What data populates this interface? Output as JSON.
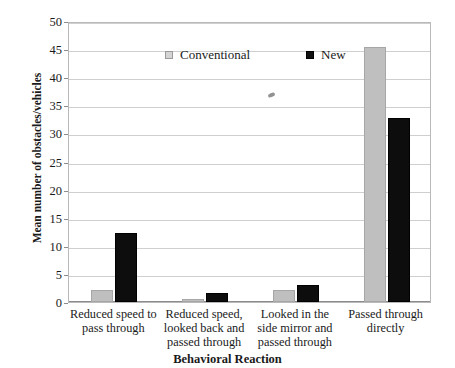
{
  "chart_data": {
    "type": "bar",
    "title": "",
    "xlabel": "Behavioral Reaction",
    "ylabel": "Mean number of obstacles/vehicles",
    "categories": [
      "Reduced speed to pass through",
      "Reduced speed, looked back and passed through",
      "Looked in the side mirror and passed through",
      "Passed through directly"
    ],
    "series": [
      {
        "name": "Conventional",
        "color": "#bfbfbf",
        "values": [
          2.1,
          0.5,
          2.2,
          45.3
        ]
      },
      {
        "name": "New",
        "color": "#0d0d0d",
        "values": [
          12.3,
          1.6,
          3.0,
          32.7
        ]
      }
    ],
    "ylim": [
      0,
      50
    ],
    "ytick_step": 5,
    "yticks": [
      "0",
      "5",
      "10",
      "15",
      "20",
      "25",
      "30",
      "35",
      "40",
      "45",
      "50"
    ],
    "grid": true,
    "legend_position": "top-inside"
  },
  "category_lines": [
    [
      "Reduced speed to",
      "pass through"
    ],
    [
      "Reduced speed,",
      "looked back and",
      "passed through"
    ],
    [
      "Looked in the",
      "side mirror and",
      "passed through"
    ],
    [
      "Passed through",
      "directly"
    ]
  ],
  "legend": {
    "items": [
      {
        "label": "Conventional",
        "color": "#d4d4d4"
      },
      {
        "label": "New",
        "color": "#111111"
      }
    ]
  },
  "axes": {
    "y_title": "Mean number of obstacles/vehicles",
    "x_title": "Behavioral Reaction"
  }
}
